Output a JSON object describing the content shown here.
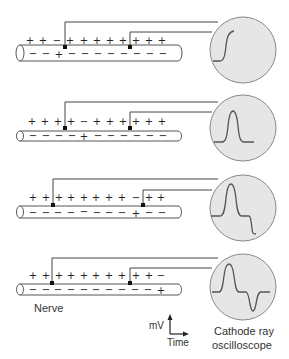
{
  "diagram": {
    "panels": [
      {
        "id": 1,
        "outside_signs": [
          "+",
          "+",
          "−",
          "+",
          "+",
          "+",
          "+",
          "+",
          "+",
          "+",
          "+"
        ],
        "inside_signs": [
          "−",
          "−",
          "+",
          "−",
          "−",
          "−",
          "−",
          "−",
          "−",
          "−",
          "−"
        ],
        "trace": "rising-step"
      },
      {
        "id": 2,
        "outside_signs": [
          "+",
          "+",
          "+",
          "+",
          "−",
          "+",
          "+",
          "+",
          "+",
          "+",
          "+"
        ],
        "inside_signs": [
          "−",
          "−",
          "−",
          "−",
          "+",
          "−",
          "−",
          "−",
          "−",
          "−",
          "−"
        ],
        "trace": "positive-peak"
      },
      {
        "id": 3,
        "outside_signs": [
          "+",
          "+",
          "+",
          "+",
          "+",
          "+",
          "+",
          "+",
          "−",
          "+",
          "+"
        ],
        "inside_signs": [
          "−",
          "−",
          "−",
          "−",
          "−",
          "−",
          "−",
          "−",
          "+",
          "−",
          "−"
        ],
        "trace": "positive-peak-then-falling"
      },
      {
        "id": 4,
        "outside_signs": [
          "+",
          "+",
          "+",
          "+",
          "+",
          "+",
          "+",
          "+",
          "+",
          "+",
          "−"
        ],
        "inside_signs": [
          "−",
          "−",
          "−",
          "−",
          "−",
          "−",
          "−",
          "−",
          "−",
          "−",
          "+"
        ],
        "trace": "biphasic"
      }
    ],
    "labels": {
      "nerve": "Nerve",
      "y_axis": "mV",
      "x_axis": "Time",
      "oscilloscope_line1": "Cathode ray",
      "oscilloscope_line2": "oscilloscope"
    },
    "colors": {
      "line": "#444444",
      "circle_fill": "#e6e6e6",
      "circle_stroke": "#888888",
      "trace": "#555555"
    }
  }
}
